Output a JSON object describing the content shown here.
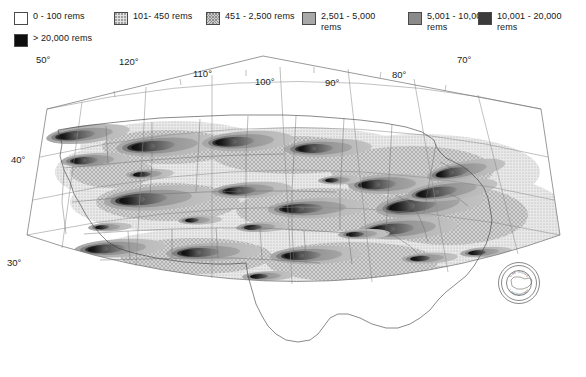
{
  "legend": {
    "items": [
      {
        "label": "0 - 100 rems",
        "swatch": "white",
        "color": "#ffffff",
        "x": 14,
        "y": 11
      },
      {
        "label": "101- 450 rems",
        "swatch": "light-stipple",
        "color": "#e2e2e2",
        "x": 114,
        "y": 11
      },
      {
        "label": "451 - 2,500 rems",
        "swatch": "cross-hatch",
        "color": "#cdcdcd",
        "x": 206,
        "y": 11
      },
      {
        "label": "2,501 - 5,000\nrems",
        "swatch": "mid-gray",
        "color": "#a8a8a8",
        "x": 302,
        "y": 11
      },
      {
        "label": "5,001 - 10,000\nrems",
        "swatch": "dark-gray",
        "color": "#8a8a8a",
        "x": 408,
        "y": 11
      },
      {
        "label": "10,001 - 20,000\nrems",
        "swatch": "very-dark",
        "color": "#3a3a3a",
        "x": 478,
        "y": 11
      },
      {
        "label": "> 20,000 rems",
        "swatch": "black",
        "color": "#0e0e0e",
        "x": 14,
        "y": 33
      }
    ]
  },
  "map": {
    "projection": "conic",
    "latitude_labels": [
      {
        "text": "50°",
        "x": 36,
        "y": 11
      },
      {
        "text": "40°",
        "x": 11,
        "y": 111
      },
      {
        "text": "30°",
        "x": 7,
        "y": 214
      }
    ],
    "longitude_labels": [
      {
        "text": "120°",
        "x": 119,
        "y": 13
      },
      {
        "text": "110°",
        "x": 193,
        "y": 25
      },
      {
        "text": "100°",
        "x": 255,
        "y": 33
      },
      {
        "text": "90°",
        "x": 325,
        "y": 34
      },
      {
        "text": "80°",
        "x": 392,
        "y": 26
      },
      {
        "text": "70°",
        "x": 457,
        "y": 11
      }
    ],
    "seal": {
      "top_text": "OAK RIDGE",
      "bottom_text": "LABORATORY",
      "cx": 519,
      "cy": 231,
      "r": 21
    }
  },
  "colors": {
    "grid": "#8d8d8d",
    "frame": "#6f6f6f",
    "coast": "#3a3a3a",
    "state": "#6a6a6a",
    "text": "#1d1d1d"
  }
}
